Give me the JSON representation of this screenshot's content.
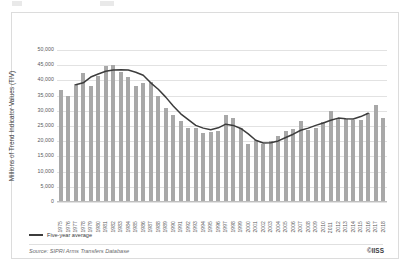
{
  "figure": {
    "credit": "©IISS",
    "source": "Source: SIPRI Arms Transfers Database"
  },
  "legend": {
    "items": [
      {
        "label": "Five-year average",
        "color": "#3c3c3c",
        "type": "line"
      }
    ]
  },
  "colors": {
    "bar": "#a8a8a8",
    "line": "#3c3c3c",
    "grid": "#e2e2e2",
    "panel_border": "#dcdcdc",
    "tick_text": "#58595b"
  },
  "chart_data": {
    "type": "bar",
    "title": "",
    "subtitle": "",
    "xlabel": "",
    "ylabel": "Millions of Trend Indicator Values (TIV)",
    "ylim": [
      0,
      50000
    ],
    "yticks": [
      0,
      5000,
      10000,
      15000,
      20000,
      25000,
      30000,
      35000,
      40000,
      45000,
      50000
    ],
    "ytick_labels": [
      "0",
      "5,000",
      "10,000",
      "15,000",
      "20,000",
      "25,000",
      "30,000",
      "35,000",
      "40,000",
      "45,000",
      "50,000"
    ],
    "grid": true,
    "legend_position": "below-left",
    "categories": [
      "1975",
      "1976",
      "1977",
      "1978",
      "1979",
      "1980",
      "1981",
      "1982",
      "1983",
      "1984",
      "1985",
      "1986",
      "1987",
      "1988",
      "1989",
      "1990",
      "1991",
      "1992",
      "1993",
      "1994",
      "1995",
      "1996",
      "1997",
      "1998",
      "1999",
      "2000",
      "2001",
      "2002",
      "2003",
      "2004",
      "2005",
      "2006",
      "2007",
      "2008",
      "2009",
      "2010",
      "2011",
      "2012",
      "2013",
      "2014",
      "2015",
      "2016",
      "2017",
      "2018"
    ],
    "series": [
      {
        "name": "Arms transfers (TIV)",
        "type": "bar",
        "values": [
          36800,
          34800,
          38700,
          42600,
          38100,
          41600,
          44700,
          45100,
          42800,
          41000,
          38000,
          39100,
          39400,
          35000,
          31000,
          28600,
          26700,
          24200,
          24400,
          22800,
          23100,
          23300,
          28500,
          27700,
          24400,
          19100,
          20300,
          19000,
          20200,
          21700,
          23300,
          23900,
          26500,
          23800,
          24200,
          26300,
          29800,
          27500,
          27200,
          26900,
          27000,
          29300,
          31800,
          27700
        ]
      },
      {
        "name": "Five-year average",
        "type": "line",
        "values": [
          null,
          null,
          38600,
          39200,
          41100,
          42100,
          43000,
          43400,
          43500,
          43400,
          42700,
          41700,
          39200,
          37100,
          34500,
          31600,
          29000,
          27100,
          25200,
          24300,
          23800,
          24400,
          25600,
          25200,
          24200,
          22400,
          20300,
          19400,
          19500,
          20100,
          21200,
          22300,
          23600,
          24300,
          25200,
          26000,
          26900,
          27600,
          27400,
          27300,
          28100,
          29200,
          null,
          null
        ]
      }
    ]
  }
}
